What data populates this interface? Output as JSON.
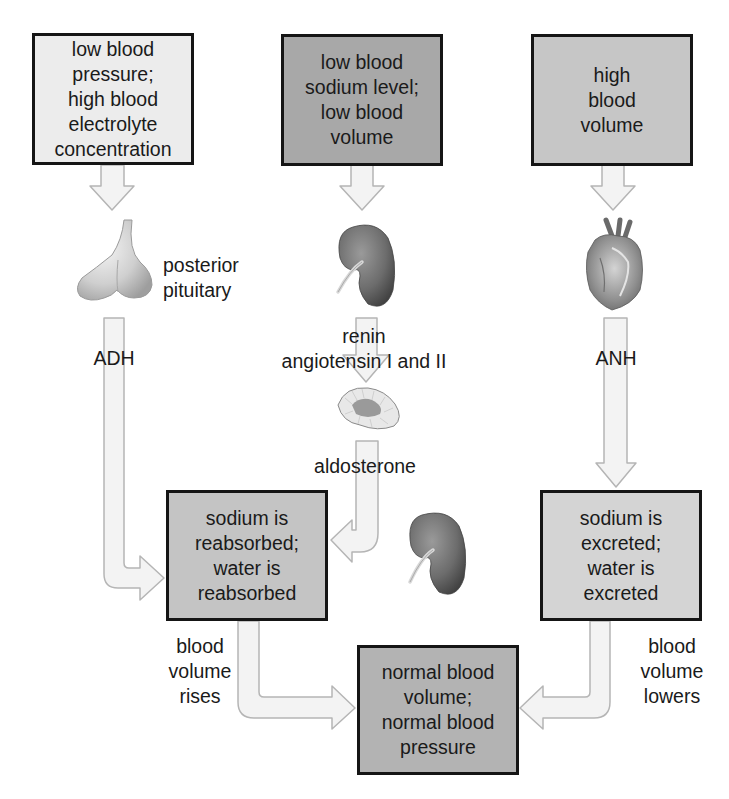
{
  "colors": {
    "box_light": "#ececec",
    "box_dark": "#a8a8a8",
    "box_medium": "#c6c6c6",
    "box_result": "#b3b3b3",
    "arrow_fill": "#f2f2f2",
    "arrow_stroke": "#b8b8b8",
    "border": "#151515"
  },
  "stimuli": [
    {
      "id": "left",
      "text": "low blood\npressure;\nhigh blood\nelectrolyte\nconcentration"
    },
    {
      "id": "middle",
      "text": "low blood\nsodium level;\nlow blood\nvolume"
    },
    {
      "id": "right",
      "text": "high\nblood\nvolume"
    }
  ],
  "organs": {
    "posterior_pituitary": {
      "label": "posterior\npituitary",
      "icon": "pituitary-gland-icon"
    },
    "kidney_top": {
      "icon": "kidney-icon"
    },
    "adrenal": {
      "icon": "adrenal-gland-icon"
    },
    "heart": {
      "icon": "heart-icon"
    },
    "kidney_bottom": {
      "icon": "kidney-icon"
    }
  },
  "hormones": {
    "adh": "ADH",
    "renin": "renin\nangiotensin I and II",
    "aldosterone": "aldosterone",
    "anh": "ANH"
  },
  "effects": {
    "reabsorb": "sodium is\nreabsorbed;\nwater is\nreabsorbed",
    "excrete": "sodium is\nexcreted;\nwater is\nexcreted"
  },
  "outcomes": {
    "rises": "blood\nvolume\nrises",
    "lowers": "blood\nvolume\nlowers",
    "normal": "normal blood\nvolume;\nnormal blood\npressure"
  }
}
